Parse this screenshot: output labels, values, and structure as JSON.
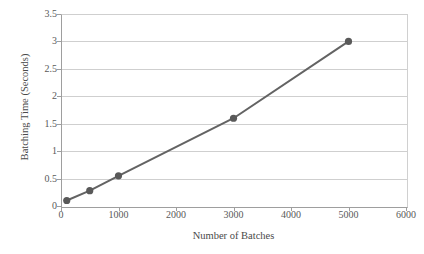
{
  "chart_data": {
    "type": "line",
    "title": "",
    "xlabel": "Number of Batches",
    "ylabel": "Batching Time (Seconds)",
    "x": [
      100,
      500,
      1000,
      3000,
      5000
    ],
    "values": [
      0.1,
      0.28,
      0.55,
      1.6,
      3.0
    ],
    "series": [
      {
        "name": "Batching Time",
        "x": [
          100,
          500,
          1000,
          3000,
          5000
        ],
        "values": [
          0.1,
          0.28,
          0.55,
          1.6,
          3.0
        ]
      }
    ],
    "xlim": [
      0,
      6000
    ],
    "ylim": [
      0,
      3.5
    ],
    "xticks": [
      0,
      1000,
      2000,
      3000,
      4000,
      5000,
      6000
    ],
    "yticks": [
      0,
      0.5,
      1,
      1.5,
      2,
      2.5,
      3,
      3.5
    ],
    "xtick_labels": [
      "0",
      "1000",
      "2000",
      "3000",
      "4000",
      "5000",
      "6000"
    ],
    "ytick_labels": [
      "0",
      "0.5",
      "1",
      "1.5",
      "2",
      "2.5",
      "3",
      "3.5"
    ],
    "grid": "horizontal",
    "legend": "none",
    "colors": {
      "series_line": "#636363",
      "marker": "#595959",
      "gridline": "#cfcfcf",
      "axis": "#9e9e9e",
      "plot_border": "#d0d0d0",
      "text": "#4a4a4a",
      "background": "#ffffff"
    },
    "marker_style": "circle",
    "line_width": 2
  }
}
